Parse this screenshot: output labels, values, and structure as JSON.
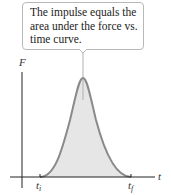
{
  "callout": {
    "lines": [
      "The impulse equals the",
      "area under the force vs.",
      "time curve."
    ]
  },
  "axes": {
    "y_label": "F",
    "x_label": "t",
    "t_start": "t",
    "t_start_sub": "i",
    "t_end": "t",
    "t_end_sub": "f"
  },
  "colors": {
    "curve": "#8a8a8a",
    "fill": "#e6e6e6",
    "axis": "#222222"
  }
}
